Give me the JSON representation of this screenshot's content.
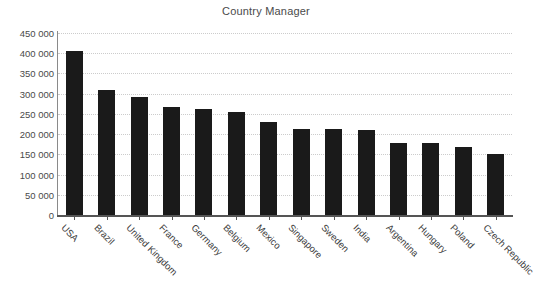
{
  "chart_data": {
    "type": "bar",
    "title": "Country Manager",
    "xlabel": "",
    "ylabel": "",
    "ylim": [
      0,
      450000
    ],
    "grid": true,
    "legend": "none",
    "orientation": "vertical",
    "bar_color": "#1a1a1a",
    "xtick_rotation": 45,
    "categories": [
      "USA",
      "Brazil",
      "United Kingdom",
      "France",
      "Germany",
      "Belgium",
      "Mexico",
      "Singapore",
      "Sweden",
      "India",
      "Argentina",
      "Hungary",
      "Poland",
      "Czech Republic"
    ],
    "values": [
      405000,
      310000,
      293000,
      267000,
      261000,
      255000,
      229000,
      213000,
      212000,
      211000,
      178000,
      178000,
      168000,
      152000
    ],
    "ytick_values": [
      0,
      50000,
      100000,
      150000,
      200000,
      250000,
      300000,
      350000,
      400000,
      450000
    ],
    "ytick_labels": [
      "0",
      "50 000",
      "100 000",
      "150 000",
      "200 000",
      "250 000",
      "300 000",
      "350 000",
      "400 000",
      "450 000"
    ]
  }
}
